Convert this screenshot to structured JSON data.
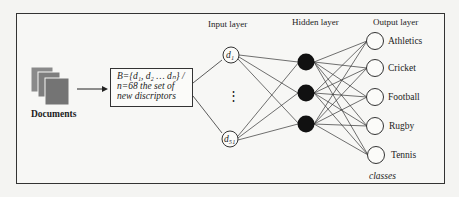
{
  "figure": {
    "documents_label": "Documents",
    "descriptor_box": {
      "line1": "B={d₁, d₂ … dₙ} /",
      "line2": "n=68 the set of",
      "line3": "new discriptors"
    },
    "layers": {
      "input_title": "Input layer",
      "hidden_title": "Hidden layer",
      "output_title": "Output layer"
    },
    "input_nodes": [
      {
        "label": "d₁"
      },
      {
        "label": "d₅₁"
      }
    ],
    "input_ellipsis": "⋮",
    "hidden_node_count": 3,
    "output_nodes": [
      {
        "label": "Athletics"
      },
      {
        "label": "Cricket"
      },
      {
        "label": "Football"
      },
      {
        "label": "Rugby"
      },
      {
        "label": "Tennis"
      }
    ],
    "classes_label": "classes",
    "colors": {
      "background": "#f4f4f2",
      "line": "#2a2a2a",
      "hidden_fill": "#111111",
      "document_fill": "#7a7a7a"
    }
  }
}
